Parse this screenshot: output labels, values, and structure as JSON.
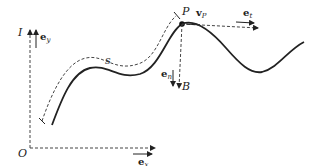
{
  "diagram": {
    "origin_label": "O",
    "inertial_frame_label": "I",
    "point_label": "P",
    "arc_length_label": "s",
    "binormal_frame_label": "B",
    "vectors": {
      "ex": {
        "base": "e",
        "sub": "x"
      },
      "ey": {
        "base": "e",
        "sub": "y"
      },
      "et": {
        "base": "e",
        "sub": "t"
      },
      "en": {
        "base": "e",
        "sub": "n"
      },
      "vP": {
        "base": "v",
        "sub": "P"
      }
    },
    "colors": {
      "curve": "#222222",
      "dashed": "#444444",
      "background": "#ffffff"
    }
  }
}
